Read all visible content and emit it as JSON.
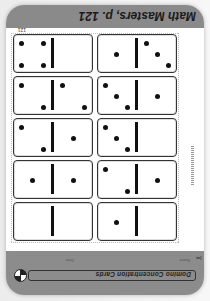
{
  "header": {
    "title": "Math Masters, p. 121"
  },
  "worksheet": {
    "name_label": "Name",
    "date_label": "Date",
    "banner_title": "Domino Concentration Cards",
    "page_number": "121",
    "logo_icon": "everyday-math-logo-icon",
    "scissors_icon": "scissors-icon"
  },
  "dominoes": [
    {
      "left": 0,
      "right": 1
    },
    {
      "left": 0,
      "right": 0
    },
    {
      "left": 1,
      "right": 2
    },
    {
      "left": 1,
      "right": 1
    },
    {
      "left": 0,
      "right": 3
    },
    {
      "left": 1,
      "right": 2
    },
    {
      "left": 1,
      "right": 3
    },
    {
      "left": 2,
      "right": 2
    },
    {
      "left": 3,
      "right": 1
    },
    {
      "left": 0,
      "right": 4
    }
  ],
  "colors": {
    "band": "#8c8c8c",
    "card": "#ffffff",
    "pip": "#111111"
  }
}
